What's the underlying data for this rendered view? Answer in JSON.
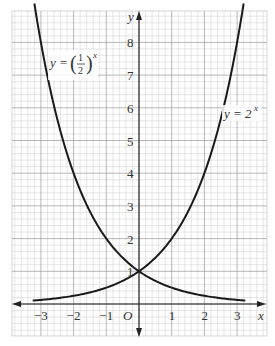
{
  "chart_data": {
    "type": "line",
    "title": "",
    "xlabel": "x",
    "ylabel": "y",
    "origin_label": "O",
    "xlim": [
      -3.9,
      3.9
    ],
    "ylim": [
      -1,
      9.3
    ],
    "grid": true,
    "x_ticks": [
      "-3",
      "-2",
      "-1",
      "1",
      "2",
      "3"
    ],
    "y_ticks": [
      "1",
      "2",
      "3",
      "4",
      "5",
      "6",
      "7",
      "8"
    ],
    "series": [
      {
        "name": "y = (1/2)^x",
        "label": "y = (½)^x",
        "x": [
          -3.2,
          -3,
          -2.5,
          -2,
          -1.5,
          -1,
          -0.5,
          0,
          0.5,
          1,
          1.5,
          2,
          2.5,
          3,
          3.2
        ],
        "y": [
          9.19,
          8,
          5.66,
          4,
          2.83,
          2,
          1.41,
          1,
          0.71,
          0.5,
          0.35,
          0.25,
          0.18,
          0.125,
          0.11
        ]
      },
      {
        "name": "y = 2^x",
        "label": "y = 2^x",
        "x": [
          -3.2,
          -3,
          -2.5,
          -2,
          -1.5,
          -1,
          -0.5,
          0,
          0.5,
          1,
          1.5,
          2,
          2.5,
          3,
          3.2
        ],
        "y": [
          0.11,
          0.125,
          0.18,
          0.25,
          0.35,
          0.5,
          0.71,
          1,
          1.41,
          2,
          2.83,
          4,
          5.66,
          8,
          9.19
        ]
      }
    ],
    "intersection": {
      "x": 0,
      "y": 1
    }
  },
  "labels": {
    "x_axis": "x",
    "y_axis": "y",
    "origin": "O",
    "curve_half": {
      "lhs": "y = ",
      "num": "1",
      "den": "2",
      "exp": "x"
    },
    "curve_two": {
      "lhs": "y = 2",
      "exp": "x"
    }
  }
}
